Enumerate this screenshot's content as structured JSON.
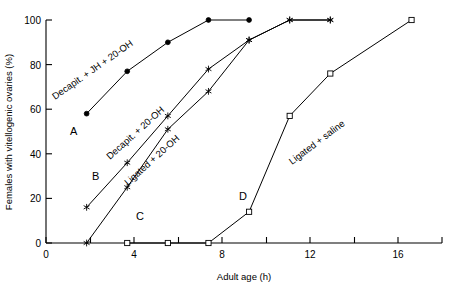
{
  "chart_data": {
    "type": "line",
    "title": "",
    "xlabel": "Adult age (h)",
    "ylabel": "Females with vitellogenic ovaries (%)",
    "xlim": [
      0,
      19.5
    ],
    "ylim": [
      0,
      100
    ],
    "xticks": [
      0,
      2,
      4,
      6,
      8,
      10,
      12,
      14,
      16,
      18
    ],
    "xticklabels": [
      "0",
      "",
      "4",
      "",
      "8",
      "",
      "12",
      "",
      "16",
      ""
    ],
    "yticks": [
      0,
      20,
      40,
      60,
      80,
      100
    ],
    "yticklabels": [
      "0",
      "20",
      "40",
      "60",
      "80",
      "100"
    ],
    "grid": false,
    "legend_position": "inline-annotations",
    "series": [
      {
        "name": "Decapit. + JH + 20-OH",
        "panel": "A",
        "marker": "filled-circle",
        "x": [
          2,
          4,
          6,
          8,
          10
        ],
        "y": [
          58,
          77,
          90,
          100,
          100
        ]
      },
      {
        "name": "Decapit. + 20-OH",
        "panel": "B",
        "marker": "star",
        "x": [
          2,
          4,
          6,
          8,
          10,
          12,
          14
        ],
        "y": [
          16,
          36,
          57,
          78,
          91,
          100,
          100
        ]
      },
      {
        "name": "Ligated + 20-OH",
        "panel": "C",
        "marker": "filled-star",
        "x": [
          2,
          4,
          6,
          8,
          10,
          12,
          14
        ],
        "y": [
          0,
          25,
          51,
          68,
          91,
          100,
          100
        ]
      },
      {
        "name": "Ligated + saline",
        "panel": "D",
        "marker": "open-square",
        "x": [
          4,
          6,
          8,
          10,
          12,
          14,
          18
        ],
        "y": [
          0,
          0,
          0,
          14,
          57,
          76,
          100
        ]
      }
    ],
    "annotations": [
      {
        "text": "Decapit. + JH + 20-OH",
        "x_px": 55,
        "y_px": 100,
        "rotation": -35
      },
      {
        "text": "Decapit. + 20-OH",
        "x_px": 110,
        "y_px": 160,
        "rotation": -42
      },
      {
        "text": "Ligated + 20-OH",
        "x_px": 128,
        "y_px": 186,
        "rotation": -42
      },
      {
        "text": "Ligated + saline",
        "x_px": 292,
        "y_px": 165,
        "rotation": -37
      },
      {
        "text": "A",
        "x_px": 70,
        "y_px": 135,
        "rotation": 0
      },
      {
        "text": "B",
        "x_px": 92,
        "y_px": 180,
        "rotation": 0
      },
      {
        "text": "C",
        "x_px": 136,
        "y_px": 220,
        "rotation": 0
      },
      {
        "text": "D",
        "x_px": 239,
        "y_px": 200,
        "rotation": 0
      }
    ]
  },
  "axes": {
    "x_title": "Adult age (h)",
    "y_title": "Females with vitellogenic ovaries (%)"
  },
  "labels": {
    "a": "A",
    "b": "B",
    "c": "C",
    "d": "D",
    "series_a": "Decapit. + JH + 20-OH",
    "series_b": "Decapit. + 20-OH",
    "series_c": "Ligated + 20-OH",
    "series_d": "Ligated + saline"
  },
  "ticks": {
    "x": [
      "0",
      "4",
      "8",
      "12",
      "16"
    ],
    "y": [
      "0",
      "20",
      "40",
      "60",
      "80",
      "100"
    ]
  },
  "colors": {
    "ink": "#000000",
    "background": "#ffffff"
  }
}
